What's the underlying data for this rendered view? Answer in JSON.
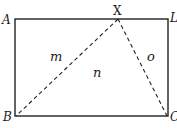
{
  "diagram": {
    "type": "geometry-figure",
    "colors": {
      "line": "#222222",
      "text": "#1a1a1a",
      "background": "#ffffff"
    },
    "rectangle": {
      "corners": {
        "top_left": "A",
        "top_right": "L",
        "bottom_left": "B",
        "bottom_right": "C"
      }
    },
    "points": {
      "A": "A",
      "L": "L",
      "B": "B",
      "C": "C",
      "X": "X"
    },
    "dashed_segments": [
      {
        "from": "X",
        "to": "B"
      },
      {
        "from": "X",
        "to": "C"
      }
    ],
    "regions": {
      "m": "m",
      "n": "n",
      "o": "o"
    }
  }
}
